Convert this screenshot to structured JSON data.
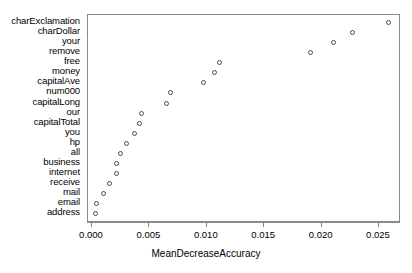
{
  "chart_data": {
    "type": "scatter",
    "title": "",
    "subtitle": "",
    "xlabel": "MeanDecreaseAccuracy",
    "ylabel": "",
    "orientation": "horizontal-dotplot",
    "grid": false,
    "legend": null,
    "xlim": [
      -0.0005,
      0.0272
    ],
    "xticks": [
      0.0,
      0.005,
      0.01,
      0.015,
      0.02,
      0.025
    ],
    "xticklabels": [
      "0.000",
      "0.005",
      "0.010",
      "0.015",
      "0.020",
      "0.025"
    ],
    "categories": [
      "charExclamation",
      "charDollar",
      "your",
      "remove",
      "free",
      "money",
      "capitalAve",
      "num000",
      "capitalLong",
      "our",
      "capitalTotal",
      "you",
      "hp",
      "all",
      "business",
      "internet",
      "receive",
      "mail",
      "email",
      "address"
    ],
    "values": [
      0.0258,
      0.0227,
      0.021,
      0.019,
      0.0111,
      0.0107,
      0.0097,
      0.0068,
      0.0065,
      0.0043,
      0.0041,
      0.0037,
      0.003,
      0.0025,
      0.0021,
      0.0021,
      0.0015,
      0.001,
      0.0004,
      0.0003
    ],
    "marker": "open-circle",
    "marker_color": "#4a4a55",
    "panel_border_color": "#8a8a8a"
  }
}
